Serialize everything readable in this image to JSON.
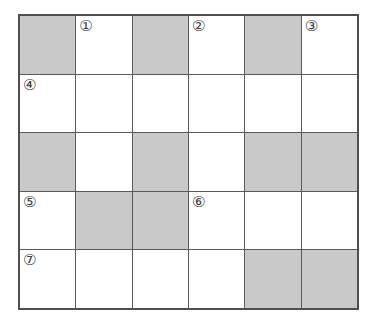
{
  "puzzle": {
    "type": "crossword-grid",
    "rows": 5,
    "columns": 6,
    "colors": {
      "page_background": "#ffffff",
      "cell_white": "#ffffff",
      "cell_shaded": "#c9c9c9",
      "grid_line": "#5a5a5a",
      "outer_border": "#4f4f4f",
      "number_text": "#3d3d3d"
    },
    "grid": [
      [
        {
          "shaded": true,
          "number": ""
        },
        {
          "shaded": false,
          "number": "①"
        },
        {
          "shaded": true,
          "number": ""
        },
        {
          "shaded": false,
          "number": "②"
        },
        {
          "shaded": true,
          "number": ""
        },
        {
          "shaded": false,
          "number": "③"
        }
      ],
      [
        {
          "shaded": false,
          "number": "④"
        },
        {
          "shaded": false,
          "number": ""
        },
        {
          "shaded": false,
          "number": ""
        },
        {
          "shaded": false,
          "number": ""
        },
        {
          "shaded": false,
          "number": ""
        },
        {
          "shaded": false,
          "number": ""
        }
      ],
      [
        {
          "shaded": true,
          "number": ""
        },
        {
          "shaded": false,
          "number": ""
        },
        {
          "shaded": true,
          "number": ""
        },
        {
          "shaded": false,
          "number": ""
        },
        {
          "shaded": true,
          "number": ""
        },
        {
          "shaded": true,
          "number": ""
        }
      ],
      [
        {
          "shaded": false,
          "number": "⑤"
        },
        {
          "shaded": true,
          "number": ""
        },
        {
          "shaded": true,
          "number": ""
        },
        {
          "shaded": false,
          "number": "⑥"
        },
        {
          "shaded": false,
          "number": ""
        },
        {
          "shaded": false,
          "number": ""
        }
      ],
      [
        {
          "shaded": false,
          "number": "⑦"
        },
        {
          "shaded": false,
          "number": ""
        },
        {
          "shaded": false,
          "number": ""
        },
        {
          "shaded": false,
          "number": ""
        },
        {
          "shaded": true,
          "number": ""
        },
        {
          "shaded": true,
          "number": ""
        }
      ]
    ],
    "clue_numbers": [
      "①",
      "②",
      "③",
      "④",
      "⑤",
      "⑥",
      "⑦"
    ]
  }
}
